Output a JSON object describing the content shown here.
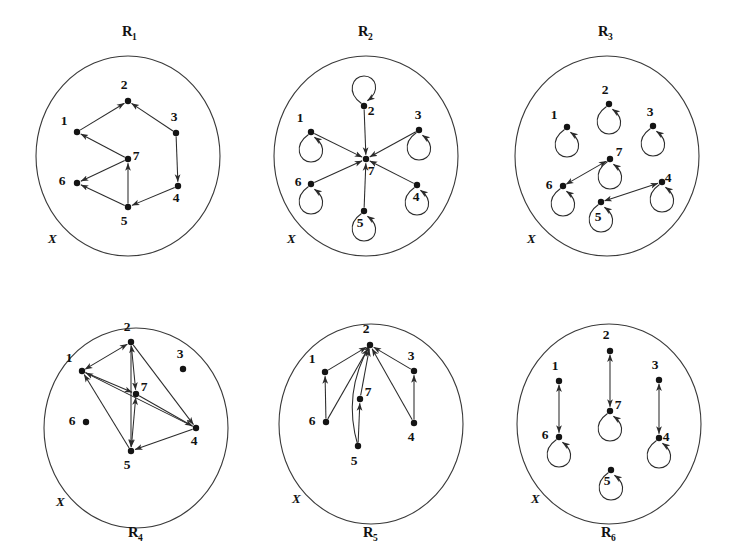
{
  "figure": {
    "universe_label": "X",
    "node_ids": [
      "1",
      "2",
      "3",
      "4",
      "5",
      "6",
      "7"
    ],
    "colors": {
      "ink": "#141414",
      "edge": "#2b2b2b",
      "circle": "#3a3a3a",
      "background": "#ffffff"
    },
    "panels": [
      {
        "id": "R1",
        "name": "R",
        "subscript": "1",
        "label_position": "top",
        "universe_label": "X",
        "circle": {
          "cx": 128,
          "cy": 156,
          "rx": 92,
          "ry": 100
        },
        "name_xy": [
          122,
          36
        ],
        "set_label_xy": [
          48,
          243
        ],
        "nodes": [
          {
            "id": "1",
            "x": 77,
            "y": 132,
            "label_dx": -13,
            "label_dy": -7
          },
          {
            "id": "2",
            "x": 128,
            "y": 101,
            "label_dx": -4,
            "label_dy": -12
          },
          {
            "id": "3",
            "x": 176,
            "y": 133,
            "label_dx": -2,
            "label_dy": -12
          },
          {
            "id": "4",
            "x": 178,
            "y": 186,
            "label_dx": -2,
            "label_dy": 16
          },
          {
            "id": "5",
            "x": 128,
            "y": 207,
            "label_dx": -4,
            "label_dy": 18
          },
          {
            "id": "6",
            "x": 77,
            "y": 183,
            "label_dx": -15,
            "label_dy": 2
          },
          {
            "id": "7",
            "x": 128,
            "y": 159,
            "label_dx": 8,
            "label_dy": 1
          }
        ],
        "edges": [
          {
            "from": "1",
            "to": "2",
            "kind": "arrow"
          },
          {
            "from": "3",
            "to": "2",
            "kind": "arrow"
          },
          {
            "from": "7",
            "to": "1",
            "kind": "arrow"
          },
          {
            "from": "3",
            "to": "4",
            "kind": "arrow"
          },
          {
            "from": "5",
            "to": "7",
            "kind": "arrow"
          },
          {
            "from": "7",
            "to": "6",
            "kind": "arrow"
          },
          {
            "from": "4",
            "to": "5",
            "kind": "arrow"
          },
          {
            "from": "5",
            "to": "6",
            "kind": "arrow"
          }
        ],
        "loops": []
      },
      {
        "id": "R2",
        "name": "R",
        "subscript": "2",
        "label_position": "top",
        "universe_label": "X",
        "circle": {
          "cx": 366,
          "cy": 156,
          "rx": 92,
          "ry": 100
        },
        "name_xy": [
          358,
          36
        ],
        "set_label_xy": [
          287,
          243
        ],
        "nodes": [
          {
            "id": "1",
            "x": 311,
            "y": 132,
            "label_dx": -11,
            "label_dy": -10
          },
          {
            "id": "2",
            "x": 364,
            "y": 106,
            "label_dx": 7,
            "label_dy": 9
          },
          {
            "id": "3",
            "x": 419,
            "y": 130,
            "label_dx": -1,
            "label_dy": -11
          },
          {
            "id": "4",
            "x": 417,
            "y": 185,
            "label_dx": -1,
            "label_dy": 16
          },
          {
            "id": "5",
            "x": 364,
            "y": 211,
            "label_dx": -4,
            "label_dy": 16
          },
          {
            "id": "6",
            "x": 311,
            "y": 184,
            "label_dx": -13,
            "label_dy": 2
          },
          {
            "id": "7",
            "x": 366,
            "y": 159,
            "label_dx": 5,
            "label_dy": 16
          }
        ],
        "edges": [
          {
            "from": "1",
            "to": "7",
            "kind": "arrow"
          },
          {
            "from": "2",
            "to": "7",
            "kind": "arrow"
          },
          {
            "from": "3",
            "to": "7",
            "kind": "arrow"
          },
          {
            "from": "4",
            "to": "7",
            "kind": "arrow"
          },
          {
            "from": "5",
            "to": "7",
            "kind": "arrow"
          },
          {
            "from": "6",
            "to": "7",
            "kind": "arrow"
          }
        ],
        "loops": [
          {
            "at": "1",
            "dir": "down"
          },
          {
            "at": "2",
            "dir": "up"
          },
          {
            "at": "3",
            "dir": "down"
          },
          {
            "at": "4",
            "dir": "down"
          },
          {
            "at": "5",
            "dir": "down"
          },
          {
            "at": "6",
            "dir": "down"
          }
        ]
      },
      {
        "id": "R3",
        "name": "R",
        "subscript": "3",
        "label_position": "top",
        "universe_label": "X",
        "circle": {
          "cx": 607,
          "cy": 156,
          "rx": 92,
          "ry": 100
        },
        "name_xy": [
          598,
          36
        ],
        "set_label_xy": [
          527,
          243
        ],
        "nodes": [
          {
            "id": "1",
            "x": 567,
            "y": 127,
            "label_dx": -13,
            "label_dy": -8
          },
          {
            "id": "2",
            "x": 609,
            "y": 104,
            "label_dx": -4,
            "label_dy": -10
          },
          {
            "id": "3",
            "x": 653,
            "y": 126,
            "label_dx": -3,
            "label_dy": -10
          },
          {
            "id": "4",
            "x": 662,
            "y": 182,
            "label_dx": 6,
            "label_dy": 0
          },
          {
            "id": "5",
            "x": 601,
            "y": 202,
            "label_dx": -3,
            "label_dy": 19
          },
          {
            "id": "6",
            "x": 563,
            "y": 186,
            "label_dx": -14,
            "label_dy": 3
          },
          {
            "id": "7",
            "x": 610,
            "y": 159,
            "label_dx": 9,
            "label_dy": -3
          }
        ],
        "edges": [
          {
            "from": "6",
            "to": "7",
            "kind": "double"
          },
          {
            "from": "5",
            "to": "4",
            "kind": "double"
          }
        ],
        "loops": [
          {
            "at": "1",
            "dir": "down"
          },
          {
            "at": "2",
            "dir": "down"
          },
          {
            "at": "3",
            "dir": "down"
          },
          {
            "at": "4",
            "dir": "down"
          },
          {
            "at": "5",
            "dir": "down"
          },
          {
            "at": "6",
            "dir": "down"
          },
          {
            "at": "7",
            "dir": "down"
          }
        ]
      },
      {
        "id": "R4",
        "name": "R",
        "subscript": "4",
        "label_position": "bottom",
        "universe_label": "X",
        "circle": {
          "cx": 136,
          "cy": 428,
          "rx": 92,
          "ry": 100
        },
        "name_xy": [
          128,
          537
        ],
        "set_label_xy": [
          56,
          506
        ],
        "nodes": [
          {
            "id": "1",
            "x": 82,
            "y": 371,
            "label_dx": -13,
            "label_dy": -9
          },
          {
            "id": "2",
            "x": 131,
            "y": 342,
            "label_dx": -4,
            "label_dy": -11
          },
          {
            "id": "3",
            "x": 183,
            "y": 369,
            "label_dx": -3,
            "label_dy": -11
          },
          {
            "id": "4",
            "x": 196,
            "y": 428,
            "label_dx": -2,
            "label_dy": 17
          },
          {
            "id": "5",
            "x": 131,
            "y": 451,
            "label_dx": -4,
            "label_dy": 18
          },
          {
            "id": "6",
            "x": 86,
            "y": 422,
            "label_dx": -14,
            "label_dy": 3
          },
          {
            "id": "7",
            "x": 136,
            "y": 394,
            "label_dx": 8,
            "label_dy": -3
          }
        ],
        "edges": [
          {
            "from": "1",
            "to": "2",
            "kind": "double"
          },
          {
            "from": "2",
            "to": "7",
            "kind": "double"
          },
          {
            "from": "7",
            "to": "5",
            "kind": "double"
          },
          {
            "from": "1",
            "to": "7",
            "kind": "arrow"
          },
          {
            "from": "2",
            "to": "4",
            "kind": "arrow"
          },
          {
            "from": "7",
            "to": "4",
            "kind": "arrow"
          },
          {
            "from": "4",
            "to": "1",
            "kind": "arrow"
          },
          {
            "from": "4",
            "to": "5",
            "kind": "arrow"
          },
          {
            "from": "5",
            "to": "1",
            "kind": "arrow"
          },
          {
            "from": "2",
            "to": "5",
            "kind": "arrow"
          }
        ],
        "loops": []
      },
      {
        "id": "R5",
        "name": "R",
        "subscript": "5",
        "label_position": "bottom",
        "universe_label": "X",
        "circle": {
          "cx": 371,
          "cy": 424,
          "rx": 92,
          "ry": 100
        },
        "name_xy": [
          363,
          537
        ],
        "set_label_xy": [
          292,
          503
        ],
        "nodes": [
          {
            "id": "1",
            "x": 325,
            "y": 372,
            "label_dx": -13,
            "label_dy": -9
          },
          {
            "id": "2",
            "x": 370,
            "y": 345,
            "label_dx": -4,
            "label_dy": -12
          },
          {
            "id": "3",
            "x": 414,
            "y": 371,
            "label_dx": -3,
            "label_dy": -11
          },
          {
            "id": "4",
            "x": 414,
            "y": 423,
            "label_dx": -3,
            "label_dy": 18
          },
          {
            "id": "5",
            "x": 358,
            "y": 446,
            "label_dx": -4,
            "label_dy": 19
          },
          {
            "id": "6",
            "x": 326,
            "y": 422,
            "label_dx": -14,
            "label_dy": 3
          },
          {
            "id": "7",
            "x": 360,
            "y": 399,
            "label_dx": 8,
            "label_dy": -3
          }
        ],
        "edges": [
          {
            "from": "1",
            "to": "2",
            "kind": "arrow"
          },
          {
            "from": "6",
            "to": "1",
            "kind": "arrow"
          },
          {
            "from": "6",
            "to": "2",
            "kind": "arrow"
          },
          {
            "from": "5",
            "to": "7",
            "kind": "arrow"
          },
          {
            "from": "7",
            "to": "2",
            "kind": "arrow"
          },
          {
            "from": "5",
            "to": "2",
            "kind": "curve",
            "bow": -22
          },
          {
            "from": "4",
            "to": "3",
            "kind": "arrow"
          },
          {
            "from": "3",
            "to": "2",
            "kind": "arrow"
          },
          {
            "from": "4",
            "to": "2",
            "kind": "arrow"
          }
        ],
        "loops": []
      },
      {
        "id": "R6",
        "name": "R",
        "subscript": "6",
        "label_position": "bottom",
        "universe_label": "X",
        "circle": {
          "cx": 609,
          "cy": 424,
          "rx": 92,
          "ry": 100
        },
        "name_xy": [
          601,
          537
        ],
        "set_label_xy": [
          531,
          503
        ],
        "nodes": [
          {
            "id": "1",
            "x": 559,
            "y": 381,
            "label_dx": -4,
            "label_dy": -11
          },
          {
            "id": "2",
            "x": 610,
            "y": 351,
            "label_dx": -4,
            "label_dy": -12
          },
          {
            "id": "3",
            "x": 659,
            "y": 380,
            "label_dx": -4,
            "label_dy": -11
          },
          {
            "id": "4",
            "x": 659,
            "y": 438,
            "label_dx": 7,
            "label_dy": 3
          },
          {
            "id": "5",
            "x": 611,
            "y": 470,
            "label_dx": -4,
            "label_dy": 15
          },
          {
            "id": "6",
            "x": 559,
            "y": 437,
            "label_dx": -14,
            "label_dy": 2
          },
          {
            "id": "7",
            "x": 610,
            "y": 411,
            "label_dx": 8,
            "label_dy": -2
          }
        ],
        "edges": [
          {
            "from": "1",
            "to": "6",
            "kind": "double"
          },
          {
            "from": "2",
            "to": "7",
            "kind": "double"
          },
          {
            "from": "3",
            "to": "4",
            "kind": "double"
          }
        ],
        "loops": [
          {
            "at": "4",
            "dir": "down"
          },
          {
            "at": "5",
            "dir": "down"
          },
          {
            "at": "6",
            "dir": "down"
          },
          {
            "at": "7",
            "dir": "down"
          }
        ]
      }
    ]
  }
}
